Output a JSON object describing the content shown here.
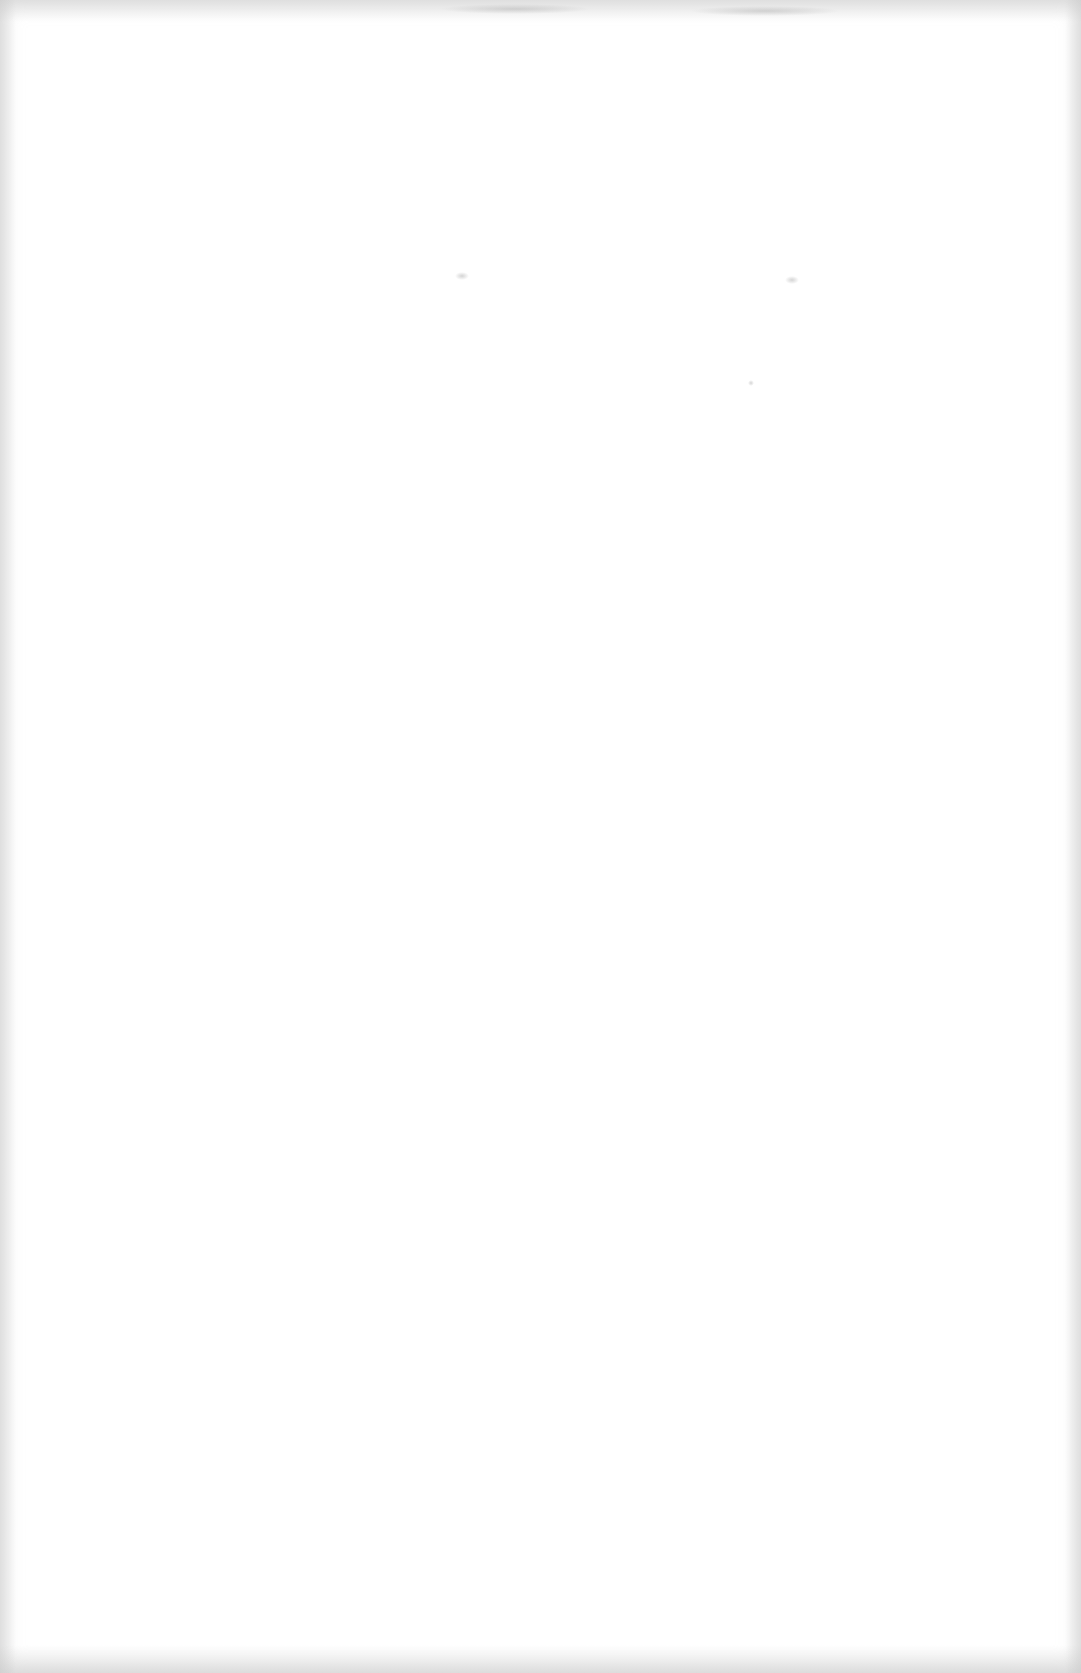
{
  "document": {
    "type": "blank scanned page",
    "text_content": []
  }
}
